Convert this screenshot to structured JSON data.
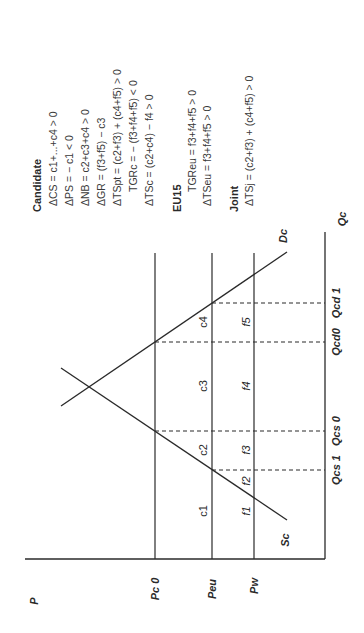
{
  "diagram": {
    "axes": {
      "price_axis_label": "P",
      "quantity_axis_label": "Qc"
    },
    "price_levels": [
      {
        "id": "pc0",
        "label": "Pc 0"
      },
      {
        "id": "peu",
        "label": "Peu"
      },
      {
        "id": "pw",
        "label": "Pw"
      }
    ],
    "quantity_levels": [
      {
        "id": "qcs1",
        "label": "Qcs 1"
      },
      {
        "id": "qcs0",
        "label": "Qcs 0"
      },
      {
        "id": "qcd0",
        "label": "Qcd0"
      },
      {
        "id": "qcd1",
        "label": "Qcd 1"
      }
    ],
    "curves": {
      "supply": "Sc",
      "demand": "Dc"
    },
    "areas": {
      "c1": "c1",
      "c2": "c2",
      "c3": "c3",
      "c4": "c4",
      "f1": "f1",
      "f2": "f2",
      "f3": "f3",
      "f4": "f4",
      "f5": "f5"
    }
  },
  "legend": {
    "candidate": {
      "title": "Candidate",
      "equations": [
        "ΔCS = c1+...+c4 > 0",
        "ΔPS = − c1 < 0",
        "ΔNB = c2+c3+c4 > 0",
        "ΔGR = (f3+f5) − c3",
        "ΔTSpt = (c2+f3) + (c4+f5) > 0",
        "TGRc = − (f3+f4+f5) < 0",
        "ΔTSc = (c2+c4) − f4 > 0"
      ]
    },
    "eu15": {
      "title": "EU15",
      "equations": [
        "TGReu = f3+f4+f5 > 0",
        "ΔTSeu = f3+f4+f5 > 0"
      ]
    },
    "joint": {
      "title": "Joint",
      "equations": [
        "ΔTSj = (c2+f3) + (c4+f5) > 0"
      ]
    }
  }
}
